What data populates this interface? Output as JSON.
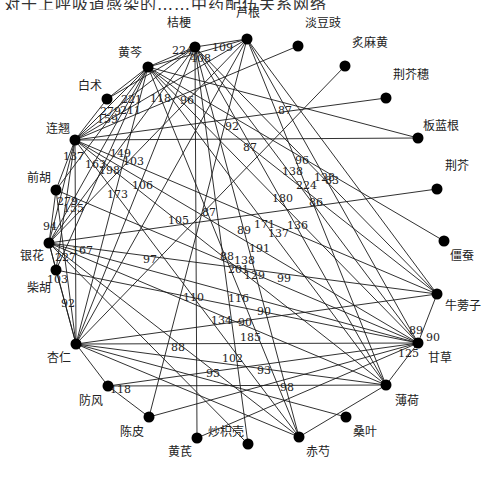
{
  "top_cropped_text": "对于上呼吸道感染的……中药配伍关系网络",
  "chart_data": {
    "type": "network",
    "nodes": [
      {
        "id": "芦根",
        "x": 247,
        "y": 39,
        "lx": 236,
        "ly": 17
      },
      {
        "id": "桔梗",
        "x": 195,
        "y": 47,
        "lx": 167,
        "ly": 27
      },
      {
        "id": "黄芩",
        "x": 148,
        "y": 67,
        "lx": 118,
        "ly": 57
      },
      {
        "id": "淡豆豉",
        "x": 298,
        "y": 46,
        "lx": 305,
        "ly": 27
      },
      {
        "id": "炙麻黄",
        "x": 345,
        "y": 66,
        "lx": 352,
        "ly": 47
      },
      {
        "id": "荆芥穗",
        "x": 386,
        "y": 98,
        "lx": 393,
        "ly": 79
      },
      {
        "id": "板蓝根",
        "x": 418,
        "y": 138,
        "lx": 423,
        "ly": 130
      },
      {
        "id": "白术",
        "x": 107,
        "y": 99,
        "lx": 78,
        "ly": 90
      },
      {
        "id": "连翘",
        "x": 75,
        "y": 140,
        "lx": 46,
        "ly": 133
      },
      {
        "id": "前胡",
        "x": 56,
        "y": 190,
        "lx": 27,
        "ly": 182
      },
      {
        "id": "荆芥",
        "x": 437,
        "y": 189,
        "lx": 445,
        "ly": 170
      },
      {
        "id": "僵蚕",
        "x": 444,
        "y": 241,
        "lx": 450,
        "ly": 260
      },
      {
        "id": "银花",
        "x": 49,
        "y": 243,
        "lx": 20,
        "ly": 260
      },
      {
        "id": "柴胡",
        "x": 56,
        "y": 270,
        "lx": 27,
        "ly": 292
      },
      {
        "id": "牛蒡子",
        "x": 437,
        "y": 294,
        "lx": 445,
        "ly": 310
      },
      {
        "id": "杏仁",
        "x": 76,
        "y": 344,
        "lx": 47,
        "ly": 362
      },
      {
        "id": "甘草",
        "x": 418,
        "y": 343,
        "lx": 428,
        "ly": 362
      },
      {
        "id": "薄荷",
        "x": 386,
        "y": 385,
        "lx": 395,
        "ly": 405
      },
      {
        "id": "防风",
        "x": 108,
        "y": 386,
        "lx": 79,
        "ly": 405
      },
      {
        "id": "陈皮",
        "x": 149,
        "y": 417,
        "lx": 120,
        "ly": 436
      },
      {
        "id": "桑叶",
        "x": 346,
        "y": 417,
        "lx": 353,
        "ly": 436
      },
      {
        "id": "黄芪",
        "x": 197,
        "y": 438,
        "lx": 168,
        "ly": 456
      },
      {
        "id": "炒枳壳",
        "x": 248,
        "y": 444,
        "lx": 208,
        "ly": 436
      },
      {
        "id": "赤芍",
        "x": 299,
        "y": 437,
        "lx": 306,
        "ly": 456
      }
    ],
    "edges": [
      [
        "黄芩",
        "桔梗"
      ],
      [
        "桔梗",
        "芦根"
      ],
      [
        "黄芩",
        "芦根"
      ],
      [
        "桔梗",
        "甘草"
      ],
      [
        "桔梗",
        "薄荷"
      ],
      [
        "桔梗",
        "赤芍"
      ],
      [
        "桔梗",
        "连翘"
      ],
      [
        "桔梗",
        "银花"
      ],
      [
        "桔梗",
        "杏仁"
      ],
      [
        "桔梗",
        "牛蒡子"
      ],
      [
        "桔梗",
        "黄芪"
      ],
      [
        "桔梗",
        "炒枳壳"
      ],
      [
        "桔梗",
        "白术"
      ],
      [
        "芦根",
        "连翘"
      ],
      [
        "芦根",
        "银花"
      ],
      [
        "芦根",
        "甘草"
      ],
      [
        "芦根",
        "薄荷"
      ],
      [
        "芦根",
        "杏仁"
      ],
      [
        "芦根",
        "牛蒡子"
      ],
      [
        "芦根",
        "陈皮"
      ],
      [
        "黄芩",
        "连翘"
      ],
      [
        "黄芩",
        "银花"
      ],
      [
        "黄芩",
        "甘草"
      ],
      [
        "黄芩",
        "薄荷"
      ],
      [
        "黄芩",
        "杏仁"
      ],
      [
        "黄芩",
        "柴胡"
      ],
      [
        "黄芩",
        "前胡"
      ],
      [
        "黄芩",
        "板蓝根"
      ],
      [
        "黄芩",
        "牛蒡子"
      ],
      [
        "黄芩",
        "赤芍"
      ],
      [
        "黄芩",
        "僵蚕"
      ],
      [
        "黄芩",
        "白术"
      ],
      [
        "淡豆豉",
        "连翘"
      ],
      [
        "炙麻黄",
        "杏仁"
      ],
      [
        "荆芥穗",
        "连翘"
      ],
      [
        "板蓝根",
        "连翘"
      ],
      [
        "荆芥",
        "银花"
      ],
      [
        "连翘",
        "甘草"
      ],
      [
        "连翘",
        "薄荷"
      ],
      [
        "连翘",
        "银花"
      ],
      [
        "连翘",
        "牛蒡子"
      ],
      [
        "连翘",
        "杏仁"
      ],
      [
        "连翘",
        "前胡"
      ],
      [
        "连翘",
        "柴胡"
      ],
      [
        "连翘",
        "赤芍"
      ],
      [
        "连翘",
        "白术"
      ],
      [
        "前胡",
        "银花"
      ],
      [
        "前胡",
        "甘草"
      ],
      [
        "前胡",
        "杏仁"
      ],
      [
        "银花",
        "甘草"
      ],
      [
        "银花",
        "薄荷"
      ],
      [
        "银花",
        "牛蒡子"
      ],
      [
        "银花",
        "柴胡"
      ],
      [
        "银花",
        "杏仁"
      ],
      [
        "银花",
        "赤芍"
      ],
      [
        "银花",
        "炒枳壳"
      ],
      [
        "柴胡",
        "甘草"
      ],
      [
        "柴胡",
        "杏仁"
      ],
      [
        "杏仁",
        "甘草"
      ],
      [
        "杏仁",
        "薄荷"
      ],
      [
        "杏仁",
        "牛蒡子"
      ],
      [
        "杏仁",
        "防风"
      ],
      [
        "杏仁",
        "赤芍"
      ],
      [
        "甘草",
        "牛蒡子"
      ],
      [
        "甘草",
        "薄荷"
      ],
      [
        "甘草",
        "防风"
      ],
      [
        "甘草",
        "陈皮"
      ],
      [
        "甘草",
        "黄芪"
      ],
      [
        "薄荷",
        "赤芍"
      ],
      [
        "防风",
        "陈皮"
      ],
      [
        "防风",
        "薄荷"
      ],
      [
        "桑叶",
        "杏仁"
      ]
    ],
    "edge_labels": [
      {
        "text": "224",
        "x": 172,
        "y": 54
      },
      {
        "text": "109",
        "x": 212,
        "y": 51
      },
      {
        "text": "408",
        "x": 190,
        "y": 62
      },
      {
        "text": "118",
        "x": 150,
        "y": 102
      },
      {
        "text": "96",
        "x": 180,
        "y": 104
      },
      {
        "text": "221",
        "x": 121,
        "y": 103
      },
      {
        "text": "279",
        "x": 100,
        "y": 115
      },
      {
        "text": "211",
        "x": 120,
        "y": 114
      },
      {
        "text": "159",
        "x": 97,
        "y": 123
      },
      {
        "text": "87",
        "x": 278,
        "y": 114
      },
      {
        "text": "92",
        "x": 225,
        "y": 130
      },
      {
        "text": "87",
        "x": 243,
        "y": 151
      },
      {
        "text": "137",
        "x": 63,
        "y": 160
      },
      {
        "text": "149",
        "x": 110,
        "y": 157
      },
      {
        "text": "103",
        "x": 123,
        "y": 165
      },
      {
        "text": "163",
        "x": 85,
        "y": 168
      },
      {
        "text": "198",
        "x": 99,
        "y": 174
      },
      {
        "text": "106",
        "x": 132,
        "y": 189
      },
      {
        "text": "173",
        "x": 107,
        "y": 198
      },
      {
        "text": "279",
        "x": 57,
        "y": 205
      },
      {
        "text": "155",
        "x": 63,
        "y": 212
      },
      {
        "text": "96",
        "x": 295,
        "y": 164
      },
      {
        "text": "138",
        "x": 282,
        "y": 175
      },
      {
        "text": "128",
        "x": 314,
        "y": 181
      },
      {
        "text": "83",
        "x": 325,
        "y": 184
      },
      {
        "text": "224",
        "x": 296,
        "y": 189
      },
      {
        "text": "180",
        "x": 272,
        "y": 202
      },
      {
        "text": "86",
        "x": 309,
        "y": 206
      },
      {
        "text": "105",
        "x": 168,
        "y": 224
      },
      {
        "text": "87",
        "x": 202,
        "y": 216
      },
      {
        "text": "171",
        "x": 254,
        "y": 228
      },
      {
        "text": "89",
        "x": 237,
        "y": 234
      },
      {
        "text": "137",
        "x": 268,
        "y": 237
      },
      {
        "text": "136",
        "x": 287,
        "y": 229
      },
      {
        "text": "191",
        "x": 249,
        "y": 252
      },
      {
        "text": "94",
        "x": 43,
        "y": 230
      },
      {
        "text": "227",
        "x": 55,
        "y": 261
      },
      {
        "text": "167",
        "x": 72,
        "y": 254
      },
      {
        "text": "97",
        "x": 143,
        "y": 263
      },
      {
        "text": "88",
        "x": 220,
        "y": 260
      },
      {
        "text": "138",
        "x": 234,
        "y": 264
      },
      {
        "text": "201",
        "x": 228,
        "y": 273
      },
      {
        "text": "129",
        "x": 244,
        "y": 279
      },
      {
        "text": "99",
        "x": 277,
        "y": 282
      },
      {
        "text": "103",
        "x": 47,
        "y": 283
      },
      {
        "text": "92",
        "x": 61,
        "y": 307
      },
      {
        "text": "110",
        "x": 183,
        "y": 301
      },
      {
        "text": "116",
        "x": 228,
        "y": 302
      },
      {
        "text": "90",
        "x": 257,
        "y": 315
      },
      {
        "text": "134",
        "x": 211,
        "y": 324
      },
      {
        "text": "90",
        "x": 238,
        "y": 326
      },
      {
        "text": "185",
        "x": 240,
        "y": 341
      },
      {
        "text": "88",
        "x": 171,
        "y": 351
      },
      {
        "text": "102",
        "x": 222,
        "y": 362
      },
      {
        "text": "95",
        "x": 206,
        "y": 377
      },
      {
        "text": "93",
        "x": 257,
        "y": 374
      },
      {
        "text": "98",
        "x": 280,
        "y": 391
      },
      {
        "text": "118",
        "x": 110,
        "y": 393
      },
      {
        "text": "90",
        "x": 426,
        "y": 341
      },
      {
        "text": "89",
        "x": 409,
        "y": 334
      },
      {
        "text": "125",
        "x": 398,
        "y": 357
      }
    ]
  }
}
